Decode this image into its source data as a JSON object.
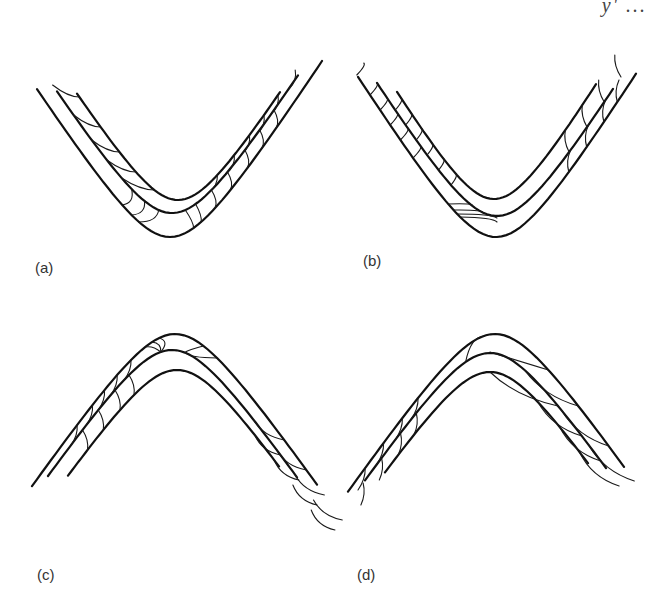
{
  "figure": {
    "corner_fragment": "y' ..."
  },
  "panels": [
    {
      "id": "a",
      "label": "(a)",
      "fold_type": "synform",
      "description": "Two folded layers with cleavage arcs; left limb cleavage fans in inner layer, right limb cleavage in both layers"
    },
    {
      "id": "b",
      "label": "(b)",
      "fold_type": "synform",
      "description": "Two folded layers; left limb with dense cleavage across both layers, hinge cleavage in outer layer, right limb cleavage in both layers"
    },
    {
      "id": "c",
      "label": "(c)",
      "fold_type": "antiform",
      "description": "Two folded layers; left limb cleavage arcs in both layers, hinge convergence of cleavage, right limb cleavage in both layers"
    },
    {
      "id": "d",
      "label": "(d)",
      "fold_type": "antiform",
      "description": "Two folded layers; left limb cleavage arcs in both layers, hinge arc in outer layer, right limb oblique cleavage in both layers"
    }
  ],
  "colors": {
    "line": "#111111",
    "background": "#ffffff",
    "label": "#333333"
  }
}
